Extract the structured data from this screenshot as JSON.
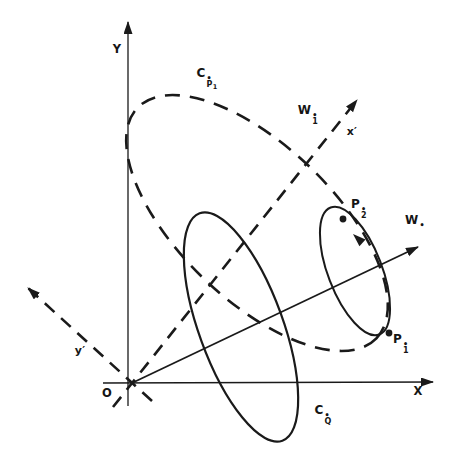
{
  "figure": {
    "background": "#ffffff",
    "ink": "#1a1a1a",
    "canvas": {
      "width": 460,
      "height": 466
    },
    "axes": [
      {
        "name": "x-axis",
        "x1": 103,
        "y1": 383,
        "x2": 433,
        "y2": 382,
        "dashed": false,
        "arrow": true,
        "width": 1.3
      },
      {
        "name": "y-axis",
        "x1": 128,
        "y1": 406,
        "x2": 128,
        "y2": 22,
        "dashed": false,
        "arrow": true,
        "width": 1.3
      },
      {
        "name": "x-prime-axis",
        "x1": 113,
        "y1": 407,
        "x2": 357,
        "y2": 100,
        "dashed": true,
        "arrow": true,
        "width": 2.6
      },
      {
        "name": "y-prime-axis",
        "x1": 152,
        "y1": 401,
        "x2": 28,
        "y2": 288,
        "dashed": true,
        "arrow": true,
        "width": 2.6
      },
      {
        "name": "w-star-vector",
        "x1": 132,
        "y1": 383,
        "x2": 418,
        "y2": 247,
        "dashed": false,
        "arrow": true,
        "width": 1.8
      }
    ],
    "ellipses": [
      {
        "name": "ellipse-c-p1",
        "cx": 257,
        "cy": 223,
        "rx": 166,
        "ry": 77,
        "rot": 44,
        "dashed": true,
        "width": 2.6
      },
      {
        "name": "ellipse-c-q",
        "cx": 241,
        "cy": 327,
        "rx": 121,
        "ry": 42,
        "rot": 70,
        "dashed": false,
        "width": 2.2
      },
      {
        "name": "ellipse-small",
        "cx": 355,
        "cy": 271,
        "rx": 68,
        "ry": 27,
        "rot": 69,
        "dashed": false,
        "width": 2.0
      }
    ],
    "points": [
      {
        "name": "point-p2",
        "x": 343,
        "y": 219,
        "r": 3.4
      },
      {
        "name": "point-p1",
        "x": 389,
        "y": 333,
        "r": 3.4
      }
    ],
    "curve_arrow": {
      "name": "ellipse-direction-arrow",
      "x": 353,
      "y": 234,
      "angle": -137,
      "len": 13,
      "halfw": 4.5
    },
    "dash_line": "13,9",
    "dash_ellipse": "15,10"
  },
  "labels": {
    "y_axis": {
      "text": "Y",
      "x": 117,
      "y": 50
    },
    "x_axis": {
      "text": "X",
      "x": 418,
      "y": 392
    },
    "origin": {
      "text": "O",
      "x": 107,
      "y": 394
    },
    "x_prime": {
      "text": "x′",
      "x": 352,
      "y": 131
    },
    "y_prime": {
      "text": "y′",
      "x": 80,
      "y": 350
    },
    "w1": {
      "base": "W",
      "sup": "•",
      "sub": "1",
      "x": 308,
      "y": 114
    },
    "w": {
      "base": "W",
      "sup": "•",
      "sub": "",
      "x": 415,
      "y": 221
    },
    "p2": {
      "base": "P",
      "sup": "•",
      "sub": "2",
      "x": 359,
      "y": 208
    },
    "p1": {
      "base": "P",
      "sup": "•",
      "sub": "1",
      "x": 401,
      "y": 343
    },
    "cp1": {
      "base": "C",
      "sup": "•",
      "sub": "P",
      "subsub": "1",
      "x": 207,
      "y": 77
    },
    "cq": {
      "base": "C",
      "sup": "•",
      "sub": "Q",
      "x": 323,
      "y": 414
    }
  }
}
